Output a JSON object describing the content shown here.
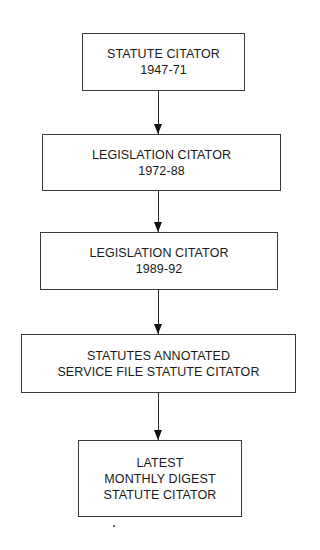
{
  "diagram": {
    "type": "flowchart",
    "direction": "top-to-bottom",
    "nodes": [
      {
        "id": "n1",
        "lines": [
          "STATUTE CITATOR",
          "1947-71"
        ]
      },
      {
        "id": "n2",
        "lines": [
          "LEGISLATION CITATOR",
          "1972-88"
        ]
      },
      {
        "id": "n3",
        "lines": [
          "LEGISLATION CITATOR",
          "1989-92"
        ]
      },
      {
        "id": "n4",
        "lines": [
          "STATUTES ANNOTATED",
          "SERVICE FILE STATUTE CITATOR"
        ]
      },
      {
        "id": "n5",
        "lines": [
          "LATEST",
          "MONTHLY DIGEST",
          "STATUTE CITATOR"
        ]
      }
    ],
    "edges": [
      {
        "from": "n1",
        "to": "n2"
      },
      {
        "from": "n2",
        "to": "n3"
      },
      {
        "from": "n3",
        "to": "n4"
      },
      {
        "from": "n4",
        "to": "n5"
      }
    ],
    "colors": {
      "line": "#2a2a2a",
      "text": "#1a1a1a",
      "background": "#ffffff"
    }
  }
}
